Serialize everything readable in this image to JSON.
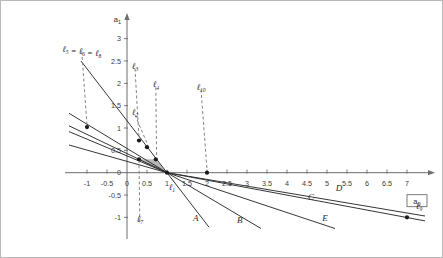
{
  "figure": {
    "kind": "line-plot",
    "background": "#ffffff",
    "frame_color": "#b9b9b9"
  },
  "axes": {
    "x_name": "a",
    "x_name_sub": "0",
    "y_name": "a",
    "y_name_sub": "1",
    "x_ticks": [
      "-1",
      "-0.5",
      "0",
      "0.5",
      "1",
      "1.5",
      "2",
      "2.5",
      "3",
      "3.5",
      "4",
      "4.5",
      "5",
      "5.5",
      "6",
      "6.5",
      "7"
    ],
    "y_ticks": [
      "3",
      "2.5",
      "2",
      "1.5",
      "1",
      "0.5",
      "0",
      "-0.5",
      "-1"
    ],
    "x_range": [
      -1.45,
      7.45
    ],
    "y_range": [
      -1.35,
      3.35
    ],
    "axis_color": "#6d6d6d",
    "grid": false
  },
  "chart_data": {
    "type": "line",
    "title": "",
    "xlabel": "a0",
    "ylabel": "a1",
    "xlim": [
      -1.45,
      7.45
    ],
    "ylim": [
      -1.35,
      3.35
    ],
    "series": [
      {
        "name": "A",
        "label": "A",
        "style": "solid",
        "points": [
          [
            -1.15,
            2.5
          ],
          [
            1.0,
            0.0
          ],
          [
            2.05,
            -1.22
          ]
        ]
      },
      {
        "name": "B",
        "label": "B",
        "style": "solid",
        "points": [
          [
            -1.45,
            1.33
          ],
          [
            1.0,
            0.0
          ],
          [
            3.35,
            -1.25
          ]
        ]
      },
      {
        "name": "C",
        "label": "C",
        "style": "solid",
        "points": [
          [
            -1.45,
            1.05
          ],
          [
            1.0,
            0.0
          ],
          [
            7.45,
            -1.08
          ]
        ]
      },
      {
        "name": "D",
        "label": "D",
        "style": "solid",
        "points": [
          [
            -1.45,
            0.92
          ],
          [
            1.0,
            0.0
          ],
          [
            7.45,
            -0.97
          ]
        ]
      },
      {
        "name": "E",
        "label": "E",
        "style": "solid",
        "points": [
          [
            -1.45,
            0.62
          ],
          [
            1.0,
            0.0
          ],
          [
            5.2,
            -1.25
          ]
        ]
      }
    ],
    "markers": [
      {
        "label": "m-left",
        "x": -1.0,
        "y": 1.02
      },
      {
        "label": "m-l3",
        "x": 0.3,
        "y": 0.72
      },
      {
        "label": "m-l2",
        "x": 0.5,
        "y": 0.57
      },
      {
        "label": "m-l7",
        "x": 0.3,
        "y": 0.3
      },
      {
        "label": "m-l4",
        "x": 0.72,
        "y": 0.3
      },
      {
        "label": "m-l1",
        "x": 1.0,
        "y": 0.0
      },
      {
        "label": "m-l10",
        "x": 2.0,
        "y": 0.0
      },
      {
        "label": "m-l9",
        "x": 7.0,
        "y": -1.0
      }
    ],
    "shaded_region": {
      "name": "feasible-region",
      "fill": "#9a9a9a",
      "opacity": 0.72,
      "vertices": [
        [
          0.3,
          0.3
        ],
        [
          0.72,
          0.3
        ],
        [
          1.0,
          0.0
        ],
        [
          0.52,
          0.16
        ]
      ]
    },
    "annotations": [
      {
        "id": "l568",
        "text": "ℓ5 = ℓ6 = ℓ8",
        "tx": -1.33,
        "ty": 2.8,
        "px": -1.0,
        "py": 1.06
      },
      {
        "id": "l3",
        "text": "ℓ3",
        "tx": 0.0,
        "ty": 2.42,
        "px": 0.3,
        "py": 0.78
      },
      {
        "id": "l4",
        "text": "ℓ4",
        "tx": 0.52,
        "ty": 2.0,
        "px": 0.74,
        "py": 0.36
      },
      {
        "id": "l2",
        "text": "ℓ2",
        "tx": 0.0,
        "ty": 1.38,
        "px": 0.52,
        "py": 0.62
      },
      {
        "id": "l10",
        "text": "ℓ10",
        "tx": 1.65,
        "ty": 1.95,
        "px": 2.0,
        "py": 0.07
      },
      {
        "id": "l7",
        "text": "ℓ7",
        "tx": 0.12,
        "ty": -1.02,
        "px": 0.3,
        "py": 0.24
      },
      {
        "id": "l1",
        "text": "ℓ1",
        "tx": 0.92,
        "ty": -0.3,
        "px": null,
        "py": null
      },
      {
        "id": "l9",
        "text": "ℓ9",
        "tx": 7.1,
        "ty": -0.72,
        "px": null,
        "py": null
      }
    ],
    "labels": {
      "l568": "ℓ5 = ℓ6 = ℓ8",
      "l3": "ℓ3",
      "l4": "ℓ4",
      "l2": "ℓ2",
      "l10": "ℓ10",
      "l7": "ℓ7",
      "l1": "ℓ1",
      "l9": "ℓ9",
      "A": "A",
      "B": "B",
      "C": "C",
      "D": "D",
      "E": "E"
    },
    "curve_label_positions": [
      {
        "key": "A",
        "x": 1.72,
        "y": -1.08
      },
      {
        "key": "B",
        "x": 2.82,
        "y": -1.12
      },
      {
        "key": "C",
        "x": 4.6,
        "y": -0.62
      },
      {
        "key": "D",
        "x": 5.3,
        "y": -0.42
      },
      {
        "key": "E",
        "x": 4.95,
        "y": -1.08
      }
    ]
  }
}
